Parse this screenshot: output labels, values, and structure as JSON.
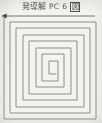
{
  "figure": {
    "caption": {
      "cjk_group": "発導解",
      "latin_label": "PC",
      "number": "6",
      "boxed_char": "図",
      "full_text": "発導解 PC 6 図"
    },
    "canvas": {
      "width": 102,
      "height": 123,
      "background_color": "#f4f3f0"
    },
    "colors": {
      "line": "#8e8d8a",
      "lead_line": "#777573",
      "arrow": "#3a3836",
      "text": "#4a4744",
      "background": "#f4f3f0"
    },
    "leader": {
      "name": "left-arrow-leader",
      "direction": "left",
      "y": 4,
      "x_start": 2,
      "x_end": 95,
      "arrow_size": 4
    }
  },
  "chart_data": {
    "type": "line",
    "title": "発導解 PC 6 図",
    "subtitle": "",
    "xlabel": "",
    "ylabel": "",
    "grid": false,
    "legend": null,
    "turns": 7,
    "winding": "clockwise-inward",
    "entry_point": "top-left",
    "center": {
      "x": 50,
      "y": 64
    },
    "bounds": {
      "x0": 4,
      "y0": 16,
      "x1": 96,
      "y1": 119
    },
    "ring_spacing": 6.6,
    "series": [
      {
        "name": "square-spiral",
        "points": [
          [
            95,
            4
          ],
          [
            2,
            4
          ],
          [
            4,
            4
          ],
          [
            4,
            107
          ],
          [
            96,
            107
          ],
          [
            96,
            10
          ],
          [
            10,
            10
          ],
          [
            10,
            101
          ],
          [
            90,
            101
          ],
          [
            90,
            16
          ],
          [
            16,
            16
          ],
          [
            16,
            95
          ],
          [
            84,
            95
          ],
          [
            84,
            23
          ],
          [
            23,
            23
          ],
          [
            23,
            88
          ],
          [
            77,
            88
          ],
          [
            77,
            29
          ],
          [
            29,
            29
          ],
          [
            29,
            82
          ],
          [
            71,
            82
          ],
          [
            71,
            36
          ],
          [
            36,
            36
          ],
          [
            36,
            75
          ],
          [
            64,
            75
          ],
          [
            64,
            42
          ],
          [
            42,
            42
          ],
          [
            42,
            69
          ],
          [
            58,
            69
          ],
          [
            58,
            49
          ],
          [
            49,
            49
          ],
          [
            49,
            62
          ],
          [
            56,
            62
          ]
        ]
      }
    ],
    "xlim": [
      0,
      102
    ],
    "ylim": [
      0,
      111
    ]
  }
}
